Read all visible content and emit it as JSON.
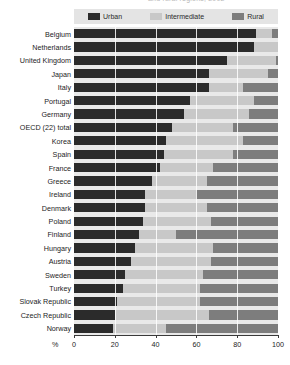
{
  "title_fragment": "and rural regions, 2002",
  "legend": {
    "items": [
      {
        "label": "Urban",
        "color": "#2b2b2b",
        "key": "urban"
      },
      {
        "label": "Intermediate",
        "color": "#c8c8c8",
        "key": "intermediate"
      },
      {
        "label": "Rural",
        "color": "#7d7d7d",
        "key": "rural"
      }
    ]
  },
  "axis": {
    "unit": "%",
    "ticks": [
      0,
      20,
      40,
      60,
      80,
      100
    ],
    "tick_labels": [
      "0",
      "20",
      "40",
      "60",
      "80",
      "100"
    ]
  },
  "chart_data": {
    "type": "bar",
    "orientation": "horizontal",
    "stacked": true,
    "stack_total": 100,
    "title": "and rural regions, 2002",
    "xlabel": "%",
    "ylabel": "",
    "xlim": [
      0,
      100
    ],
    "grid": true,
    "legend_position": "top",
    "categories": [
      "Belgium",
      "Netherlands",
      "United Kingdom",
      "Japan",
      "Italy",
      "Portugal",
      "Germany",
      "OECD (22) total",
      "Korea",
      "Spain",
      "France",
      "Greece",
      "Ireland",
      "Denmark",
      "Poland",
      "Finland",
      "Hungary",
      "Austria",
      "Sweden",
      "Turkey",
      "Slovak Republic",
      "Czech Republic",
      "Norway"
    ],
    "series": [
      {
        "name": "Urban",
        "color": "#2b2b2b",
        "values": [
          89,
          88,
          75,
          66,
          66,
          57,
          54,
          48,
          45,
          44,
          42,
          38,
          35,
          35,
          34,
          32,
          30,
          28,
          25,
          24,
          21,
          20,
          19
        ]
      },
      {
        "name": "Intermediate",
        "color": "#c8c8c8",
        "values": [
          8,
          12,
          24,
          29,
          17,
          31,
          32,
          30,
          38,
          34,
          26,
          27,
          25,
          30,
          33,
          18,
          38,
          39,
          38,
          38,
          41,
          46,
          26
        ]
      },
      {
        "name": "Rural",
        "color": "#7d7d7d",
        "values": [
          3,
          0,
          1,
          5,
          17,
          12,
          14,
          22,
          17,
          22,
          32,
          35,
          40,
          35,
          33,
          50,
          32,
          33,
          37,
          38,
          38,
          34,
          55
        ]
      }
    ]
  }
}
